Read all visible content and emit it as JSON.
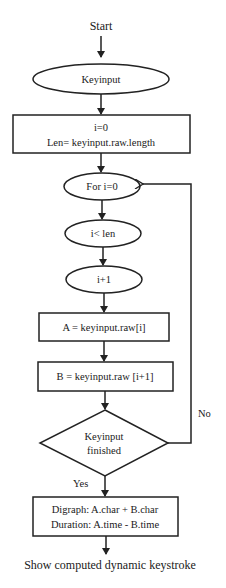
{
  "diagram": {
    "type": "flowchart",
    "start_label": "Start",
    "nodes": {
      "keyinput": "Keyinput",
      "init_line1": "i=0",
      "init_line2": "Len= keyinput.raw.length",
      "for_loop": "For i=0",
      "condition": "i< len",
      "increment": "i+1",
      "assign_a": "A = keyinput.raw[i]",
      "assign_b": "B = keyinput.raw  [i+1]",
      "decision_line1": "Keyinput",
      "decision_line2": "finished",
      "result_line1": "Digraph: A.char + B.char",
      "result_line2": "Duration:  A.time  - B.time"
    },
    "edge_labels": {
      "no": "No",
      "yes": "Yes"
    },
    "end_label": "Show computed dynamic keystroke"
  }
}
